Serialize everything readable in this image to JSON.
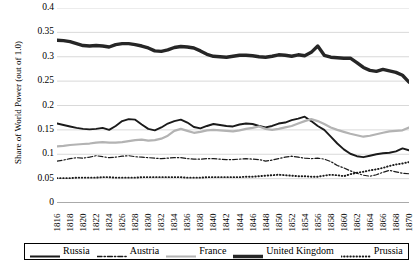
{
  "chart_data": {
    "type": "line",
    "title": "",
    "xlabel": "",
    "ylabel": "Share of World Power (out of 1.0)",
    "ylim": [
      0,
      0.4
    ],
    "yticks": [
      "0",
      "0.05",
      "0.1",
      "0.15",
      "0.2",
      "0.25",
      "0.3",
      "0.35",
      "0.4"
    ],
    "ytick_values": [
      0,
      0.05,
      0.1,
      0.15,
      0.2,
      0.25,
      0.3,
      0.35,
      0.4
    ],
    "grid": "horizontal",
    "legend_position": "bottom",
    "xtick_labels": [
      "1816",
      "1818",
      "1820",
      "1822",
      "1824",
      "1826",
      "1828",
      "1830",
      "1832",
      "1834",
      "1836",
      "1838",
      "1840",
      "1842",
      "1844",
      "1846",
      "1848",
      "1850",
      "1852",
      "1854",
      "1856",
      "1858",
      "1860",
      "1862",
      "1864",
      "1866",
      "1868",
      "1870"
    ],
    "x": [
      1816,
      1817,
      1818,
      1819,
      1820,
      1821,
      1822,
      1823,
      1824,
      1825,
      1826,
      1827,
      1828,
      1829,
      1830,
      1831,
      1832,
      1833,
      1834,
      1835,
      1836,
      1837,
      1838,
      1839,
      1840,
      1841,
      1842,
      1843,
      1844,
      1845,
      1846,
      1847,
      1848,
      1849,
      1850,
      1851,
      1852,
      1853,
      1854,
      1855,
      1856,
      1857,
      1858,
      1859,
      1860,
      1861,
      1862,
      1863,
      1864,
      1865,
      1866,
      1867,
      1868,
      1869,
      1870
    ],
    "series": [
      {
        "name": "Russia",
        "color": "#1a1a1a",
        "style": "solid",
        "width": 1.9,
        "values": [
          0.163,
          0.16,
          0.157,
          0.154,
          0.152,
          0.151,
          0.152,
          0.154,
          0.15,
          0.158,
          0.168,
          0.172,
          0.171,
          0.161,
          0.152,
          0.149,
          0.155,
          0.163,
          0.168,
          0.171,
          0.165,
          0.156,
          0.153,
          0.158,
          0.162,
          0.16,
          0.158,
          0.157,
          0.161,
          0.163,
          0.162,
          0.158,
          0.155,
          0.158,
          0.163,
          0.165,
          0.17,
          0.173,
          0.177,
          0.168,
          0.158,
          0.15,
          0.136,
          0.122,
          0.11,
          0.101,
          0.096,
          0.094,
          0.097,
          0.1,
          0.102,
          0.103,
          0.106,
          0.112,
          0.108
        ]
      },
      {
        "name": "Austria",
        "color": "#1a1a1a",
        "style": "dashdot",
        "width": 1.2,
        "values": [
          0.086,
          0.088,
          0.091,
          0.093,
          0.092,
          0.094,
          0.097,
          0.095,
          0.093,
          0.094,
          0.096,
          0.097,
          0.095,
          0.094,
          0.093,
          0.092,
          0.091,
          0.092,
          0.093,
          0.093,
          0.091,
          0.09,
          0.09,
          0.091,
          0.091,
          0.09,
          0.089,
          0.089,
          0.09,
          0.091,
          0.09,
          0.089,
          0.086,
          0.088,
          0.091,
          0.094,
          0.096,
          0.094,
          0.092,
          0.091,
          0.092,
          0.09,
          0.085,
          0.077,
          0.072,
          0.066,
          0.061,
          0.057,
          0.055,
          0.058,
          0.063,
          0.067,
          0.064,
          0.061,
          0.06
        ]
      },
      {
        "name": "France",
        "color": "#b3b3b3",
        "style": "solid",
        "width": 2.2,
        "values": [
          0.116,
          0.117,
          0.119,
          0.12,
          0.121,
          0.122,
          0.124,
          0.125,
          0.124,
          0.124,
          0.125,
          0.127,
          0.129,
          0.13,
          0.128,
          0.129,
          0.132,
          0.138,
          0.148,
          0.152,
          0.148,
          0.144,
          0.146,
          0.149,
          0.15,
          0.149,
          0.148,
          0.147,
          0.149,
          0.152,
          0.154,
          0.157,
          0.152,
          0.15,
          0.152,
          0.155,
          0.158,
          0.163,
          0.168,
          0.172,
          0.168,
          0.162,
          0.155,
          0.15,
          0.146,
          0.142,
          0.139,
          0.136,
          0.138,
          0.141,
          0.144,
          0.147,
          0.148,
          0.149,
          0.155
        ]
      },
      {
        "name": "United Kingdom",
        "color": "#262626",
        "style": "solid",
        "width": 3.4,
        "values": [
          0.334,
          0.333,
          0.331,
          0.327,
          0.323,
          0.322,
          0.323,
          0.322,
          0.32,
          0.325,
          0.327,
          0.327,
          0.325,
          0.322,
          0.318,
          0.312,
          0.311,
          0.314,
          0.319,
          0.321,
          0.32,
          0.318,
          0.312,
          0.305,
          0.301,
          0.3,
          0.299,
          0.301,
          0.303,
          0.303,
          0.302,
          0.3,
          0.299,
          0.301,
          0.304,
          0.303,
          0.301,
          0.304,
          0.302,
          0.309,
          0.322,
          0.303,
          0.299,
          0.298,
          0.297,
          0.297,
          0.288,
          0.278,
          0.272,
          0.27,
          0.274,
          0.271,
          0.268,
          0.262,
          0.248
        ]
      },
      {
        "name": "Prussia",
        "color": "#1a1a1a",
        "style": "dotted",
        "width": 1.9,
        "values": [
          0.051,
          0.051,
          0.051,
          0.052,
          0.052,
          0.052,
          0.052,
          0.053,
          0.053,
          0.052,
          0.052,
          0.052,
          0.052,
          0.053,
          0.053,
          0.053,
          0.053,
          0.053,
          0.053,
          0.053,
          0.052,
          0.052,
          0.052,
          0.053,
          0.053,
          0.053,
          0.053,
          0.053,
          0.053,
          0.054,
          0.054,
          0.055,
          0.056,
          0.057,
          0.058,
          0.057,
          0.056,
          0.055,
          0.055,
          0.054,
          0.054,
          0.056,
          0.058,
          0.057,
          0.055,
          0.059,
          0.062,
          0.064,
          0.067,
          0.069,
          0.072,
          0.076,
          0.079,
          0.081,
          0.084
        ]
      }
    ]
  },
  "legend": {
    "items": [
      {
        "label": "Russia"
      },
      {
        "label": "Austria"
      },
      {
        "label": "France"
      },
      {
        "label": "United Kingdom"
      },
      {
        "label": "Prussia"
      }
    ]
  }
}
